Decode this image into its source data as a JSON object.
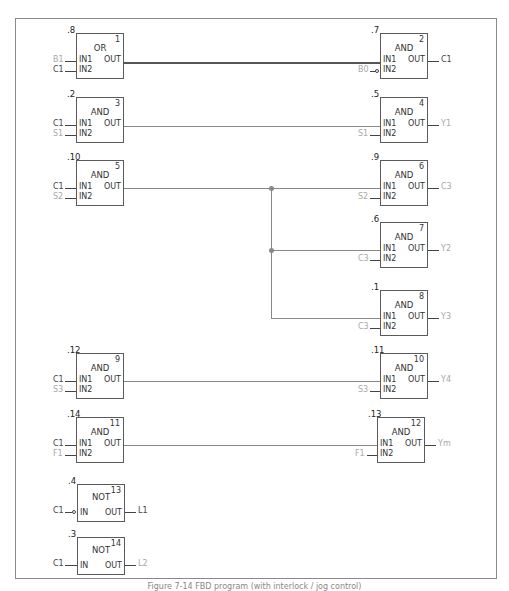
{
  "diagram": {
    "type": "FBD function block diagram",
    "blocks": [
      {
        "id": 1,
        "type": "OR",
        "order": ".8",
        "side": "left",
        "inputs": [
          {
            "pin": "IN1",
            "signal": "B1",
            "shade": "light"
          },
          {
            "pin": "IN2",
            "signal": "C1",
            "shade": "dark"
          }
        ],
        "output": {
          "pin": "OUT",
          "signal": ""
        }
      },
      {
        "id": 2,
        "type": "AND",
        "order": ".7",
        "side": "right",
        "inputs": [
          {
            "pin": "IN1",
            "signal": ""
          },
          {
            "pin": "IN2",
            "signal": "B0",
            "shade": "light",
            "negated": true
          }
        ],
        "output": {
          "pin": "OUT",
          "signal": "C1",
          "shade": "dark"
        }
      },
      {
        "id": 3,
        "type": "AND",
        "order": ".2",
        "side": "left",
        "inputs": [
          {
            "pin": "IN1",
            "signal": "C1",
            "shade": "dark"
          },
          {
            "pin": "IN2",
            "signal": "S1",
            "shade": "light"
          }
        ],
        "output": {
          "pin": "OUT",
          "signal": ""
        }
      },
      {
        "id": 4,
        "type": "AND",
        "order": ".5",
        "side": "right",
        "inputs": [
          {
            "pin": "IN1",
            "signal": ""
          },
          {
            "pin": "IN2",
            "signal": "S1",
            "shade": "light"
          }
        ],
        "output": {
          "pin": "OUT",
          "signal": "Y1",
          "shade": "light"
        }
      },
      {
        "id": 5,
        "type": "AND",
        "order": ".10",
        "side": "left",
        "inputs": [
          {
            "pin": "IN1",
            "signal": "C1",
            "shade": "dark"
          },
          {
            "pin": "IN2",
            "signal": "S2",
            "shade": "light"
          }
        ],
        "output": {
          "pin": "OUT",
          "signal": ""
        }
      },
      {
        "id": 6,
        "type": "AND",
        "order": ".9",
        "side": "right",
        "inputs": [
          {
            "pin": "IN1",
            "signal": ""
          },
          {
            "pin": "IN2",
            "signal": "S2",
            "shade": "light"
          }
        ],
        "output": {
          "pin": "OUT",
          "signal": "C3",
          "shade": "light"
        }
      },
      {
        "id": 7,
        "type": "AND",
        "order": ".6",
        "side": "right",
        "inputs": [
          {
            "pin": "IN1",
            "signal": ""
          },
          {
            "pin": "IN2",
            "signal": "C3",
            "shade": "light"
          }
        ],
        "output": {
          "pin": "OUT",
          "signal": "Y2",
          "shade": "light"
        }
      },
      {
        "id": 8,
        "type": "AND",
        "order": ".1",
        "side": "right",
        "inputs": [
          {
            "pin": "IN1",
            "signal": ""
          },
          {
            "pin": "IN2",
            "signal": "C3",
            "shade": "light"
          }
        ],
        "output": {
          "pin": "OUT",
          "signal": "Y3",
          "shade": "light"
        }
      },
      {
        "id": 9,
        "type": "AND",
        "order": ".12",
        "side": "left",
        "inputs": [
          {
            "pin": "IN1",
            "signal": "C1",
            "shade": "dark"
          },
          {
            "pin": "IN2",
            "signal": "S3",
            "shade": "light"
          }
        ],
        "output": {
          "pin": "OUT",
          "signal": ""
        }
      },
      {
        "id": 10,
        "type": "AND",
        "order": ".11",
        "side": "right",
        "inputs": [
          {
            "pin": "IN1",
            "signal": ""
          },
          {
            "pin": "IN2",
            "signal": "S3",
            "shade": "light"
          }
        ],
        "output": {
          "pin": "OUT",
          "signal": "Y4",
          "shade": "light"
        }
      },
      {
        "id": 11,
        "type": "AND",
        "order": ".14",
        "side": "left",
        "inputs": [
          {
            "pin": "IN1",
            "signal": "C1",
            "shade": "dark"
          },
          {
            "pin": "IN2",
            "signal": "F1",
            "shade": "light"
          }
        ],
        "output": {
          "pin": "OUT",
          "signal": ""
        }
      },
      {
        "id": 12,
        "type": "AND",
        "order": ".13",
        "side": "right",
        "inputs": [
          {
            "pin": "IN1",
            "signal": ""
          },
          {
            "pin": "IN2",
            "signal": "F1",
            "shade": "light"
          }
        ],
        "output": {
          "pin": "OUT",
          "signal": "Ym",
          "shade": "light"
        }
      },
      {
        "id": 13,
        "type": "NOT",
        "order": ".4",
        "side": "left",
        "inputs": [
          {
            "pin": "IN",
            "signal": "C1",
            "shade": "dark",
            "negated": true
          }
        ],
        "output": {
          "pin": "OUT",
          "signal": "L1",
          "shade": "dark"
        }
      },
      {
        "id": 14,
        "type": "NOT",
        "order": ".3",
        "side": "left",
        "inputs": [
          {
            "pin": "IN",
            "signal": "C1",
            "shade": "dark"
          }
        ],
        "output": {
          "pin": "OUT",
          "signal": "L2",
          "shade": "light"
        }
      }
    ],
    "connections": [
      {
        "from": "1.OUT",
        "to": "2.IN1"
      },
      {
        "from": "3.OUT",
        "to": "4.IN1"
      },
      {
        "from": "5.OUT",
        "to": [
          "6.IN1",
          "7.IN1",
          "8.IN1"
        ]
      },
      {
        "from": "9.OUT",
        "to": "10.IN1"
      },
      {
        "from": "11.OUT",
        "to": "12.IN1"
      }
    ],
    "caption": "Figure 7-14  FBD ..."
  },
  "b": {
    "b1": {
      "type": "OR",
      "num": "1",
      "order": ".8",
      "in1": "IN1",
      "in2": "IN2",
      "out": "OUT",
      "s_in1": "B1",
      "s_in2": "C1"
    },
    "b2": {
      "type": "AND",
      "num": "2",
      "order": ".7",
      "in1": "IN1",
      "in2": "IN2",
      "out": "OUT",
      "s_in2": "B0",
      "s_out": "C1"
    },
    "b3": {
      "type": "AND",
      "num": "3",
      "order": ".2",
      "in1": "IN1",
      "in2": "IN2",
      "out": "OUT",
      "s_in1": "C1",
      "s_in2": "S1"
    },
    "b4": {
      "type": "AND",
      "num": "4",
      "order": ".5",
      "in1": "IN1",
      "in2": "IN2",
      "out": "OUT",
      "s_in2": "S1",
      "s_out": "Y1"
    },
    "b5": {
      "type": "AND",
      "num": "5",
      "order": ".10",
      "in1": "IN1",
      "in2": "IN2",
      "out": "OUT",
      "s_in1": "C1",
      "s_in2": "S2"
    },
    "b6": {
      "type": "AND",
      "num": "6",
      "order": ".9",
      "in1": "IN1",
      "in2": "IN2",
      "out": "OUT",
      "s_in2": "S2",
      "s_out": "C3"
    },
    "b7": {
      "type": "AND",
      "num": "7",
      "order": ".6",
      "in1": "IN1",
      "in2": "IN2",
      "out": "OUT",
      "s_in2": "C3",
      "s_out": "Y2"
    },
    "b8": {
      "type": "AND",
      "num": "8",
      "order": ".1",
      "in1": "IN1",
      "in2": "IN2",
      "out": "OUT",
      "s_in2": "C3",
      "s_out": "Y3"
    },
    "b9": {
      "type": "AND",
      "num": "9",
      "order": ".12",
      "in1": "IN1",
      "in2": "IN2",
      "out": "OUT",
      "s_in1": "C1",
      "s_in2": "S3"
    },
    "b10": {
      "type": "AND",
      "num": "10",
      "order": ".11",
      "in1": "IN1",
      "in2": "IN2",
      "out": "OUT",
      "s_in2": "S3",
      "s_out": "Y4"
    },
    "b11": {
      "type": "AND",
      "num": "11",
      "order": ".14",
      "in1": "IN1",
      "in2": "IN2",
      "out": "OUT",
      "s_in1": "C1",
      "s_in2": "F1"
    },
    "b12": {
      "type": "AND",
      "num": "12",
      "order": ".13",
      "in1": "IN1",
      "in2": "IN2",
      "out": "OUT",
      "s_in2": "F1",
      "s_out": "Ym"
    },
    "b13": {
      "type": "NOT",
      "num": "13",
      "order": ".4",
      "in": "IN",
      "out": "OUT",
      "s_in": "C1",
      "s_out": "L1"
    },
    "b14": {
      "type": "NOT",
      "num": "14",
      "order": ".3",
      "in": "IN",
      "out": "OUT",
      "s_in": "C1",
      "s_out": "L2"
    }
  },
  "caption": "Figure 7-14  FBD program (with interlock / jog control)"
}
